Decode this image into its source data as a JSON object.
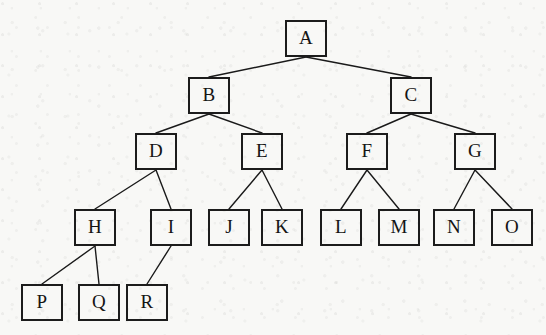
{
  "diagram": {
    "type": "tree",
    "canvas": {
      "width": 546,
      "height": 335
    },
    "style": {
      "background_color": "#f8f8f6",
      "node_border_color": "#1c1c1c",
      "node_fill_color": "transparent",
      "edge_color": "#1a1a1a",
      "label_color": "#141414",
      "node_border_width": 2,
      "edge_width": 1.4,
      "node_width": 42,
      "node_height": 37
    },
    "nodes": [
      {
        "id": "A",
        "label": "A",
        "level": 0,
        "x": 285,
        "y": 20
      },
      {
        "id": "B",
        "label": "B",
        "level": 1,
        "x": 188,
        "y": 77
      },
      {
        "id": "C",
        "label": "C",
        "level": 1,
        "x": 390,
        "y": 77
      },
      {
        "id": "D",
        "label": "D",
        "level": 2,
        "x": 135,
        "y": 133
      },
      {
        "id": "E",
        "label": "E",
        "level": 2,
        "x": 241,
        "y": 133
      },
      {
        "id": "F",
        "label": "F",
        "level": 2,
        "x": 346,
        "y": 133
      },
      {
        "id": "G",
        "label": "G",
        "level": 2,
        "x": 454,
        "y": 133
      },
      {
        "id": "H",
        "label": "H",
        "level": 3,
        "x": 74,
        "y": 209
      },
      {
        "id": "I",
        "label": "I",
        "level": 3,
        "x": 150,
        "y": 209
      },
      {
        "id": "J",
        "label": "J",
        "level": 3,
        "x": 208,
        "y": 209
      },
      {
        "id": "K",
        "label": "K",
        "level": 3,
        "x": 261,
        "y": 209
      },
      {
        "id": "L",
        "label": "L",
        "level": 3,
        "x": 320,
        "y": 209
      },
      {
        "id": "M",
        "label": "M",
        "level": 3,
        "x": 378,
        "y": 209
      },
      {
        "id": "N",
        "label": "N",
        "level": 3,
        "x": 433,
        "y": 209
      },
      {
        "id": "O",
        "label": "O",
        "level": 3,
        "x": 491,
        "y": 209
      },
      {
        "id": "P",
        "label": "P",
        "level": 4,
        "x": 21,
        "y": 284
      },
      {
        "id": "Q",
        "label": "Q",
        "level": 4,
        "x": 78,
        "y": 284
      },
      {
        "id": "R",
        "label": "R",
        "level": 4,
        "x": 126,
        "y": 284
      }
    ],
    "edges": [
      {
        "from": "A",
        "to": "B"
      },
      {
        "from": "A",
        "to": "C"
      },
      {
        "from": "B",
        "to": "D"
      },
      {
        "from": "B",
        "to": "E"
      },
      {
        "from": "C",
        "to": "F"
      },
      {
        "from": "C",
        "to": "G"
      },
      {
        "from": "D",
        "to": "H"
      },
      {
        "from": "D",
        "to": "I"
      },
      {
        "from": "E",
        "to": "J"
      },
      {
        "from": "E",
        "to": "K"
      },
      {
        "from": "F",
        "to": "L"
      },
      {
        "from": "F",
        "to": "M"
      },
      {
        "from": "G",
        "to": "N"
      },
      {
        "from": "G",
        "to": "O"
      },
      {
        "from": "H",
        "to": "P"
      },
      {
        "from": "H",
        "to": "Q"
      },
      {
        "from": "I",
        "to": "R"
      }
    ]
  }
}
